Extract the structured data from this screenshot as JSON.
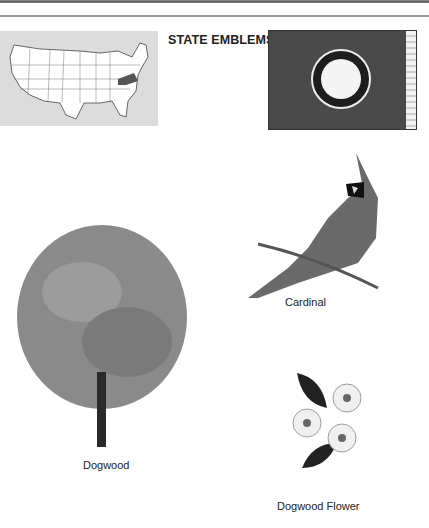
{
  "page": {
    "title": "STATE EMBLEMS",
    "highlighted_state": "Virginia"
  },
  "emblems": {
    "tree": {
      "label": "Dogwood"
    },
    "bird": {
      "label": "Cardinal"
    },
    "flower": {
      "label": "Dogwood Flower"
    }
  },
  "colors": {
    "flag_field": "#4a4a4a",
    "map_background": "#dcdcdc",
    "highlight_state": "#555555"
  }
}
